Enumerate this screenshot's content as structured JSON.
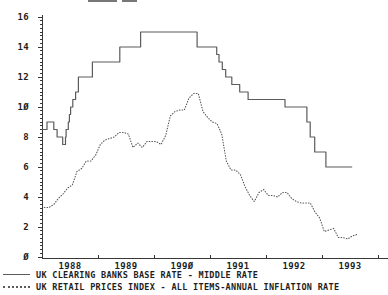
{
  "window": {
    "width": 388,
    "height": 295,
    "background": "#ffffff"
  },
  "colors": {
    "background": "#ffffff",
    "axis": "#383838",
    "text": "#1e1e1e",
    "base_rate_line": "#5b5b5b",
    "inflation_line": "#555555"
  },
  "chart_data": {
    "type": "line",
    "title": "",
    "grid": false,
    "legend_position": "bottom-left",
    "x_axis": {
      "label": "",
      "range": [
        1988,
        1994.2
      ],
      "tick_years": [
        1988,
        1989,
        1990,
        1991,
        1992,
        1993,
        1994
      ],
      "tick_labels": [
        "1988",
        "1989",
        "199Ø",
        "1991",
        "1992",
        "1993"
      ]
    },
    "y_axis": {
      "label": "",
      "range": [
        0,
        16
      ],
      "minor_step": 0.25,
      "tick_values": [
        0,
        2,
        4,
        6,
        8,
        10,
        12,
        14,
        16
      ],
      "tick_labels": [
        "Ø",
        "2",
        "4",
        "6",
        "8",
        "1Ø",
        "12",
        "14",
        "16"
      ]
    },
    "series": [
      {
        "name": "UK CLEARING BANKS BASE RATE - MIDDLE RATE",
        "style": "solid-step",
        "color": "#5b5b5b",
        "unit": "percent",
        "steps": [
          [
            1988.0,
            8.5
          ],
          [
            1988.09,
            9.0
          ],
          [
            1988.21,
            8.5
          ],
          [
            1988.27,
            8.0
          ],
          [
            1988.37,
            7.5
          ],
          [
            1988.42,
            8.0
          ],
          [
            1988.43,
            8.5
          ],
          [
            1988.47,
            9.0
          ],
          [
            1988.49,
            9.5
          ],
          [
            1988.51,
            10.0
          ],
          [
            1988.55,
            10.5
          ],
          [
            1988.6,
            11.0
          ],
          [
            1988.65,
            12.0
          ],
          [
            1988.9,
            13.0
          ],
          [
            1989.39,
            14.0
          ],
          [
            1989.76,
            15.0
          ],
          [
            1990.77,
            14.0
          ],
          [
            1991.12,
            13.5
          ],
          [
            1991.16,
            13.0
          ],
          [
            1991.22,
            12.5
          ],
          [
            1991.28,
            12.0
          ],
          [
            1991.39,
            11.5
          ],
          [
            1991.53,
            11.0
          ],
          [
            1991.68,
            10.5
          ],
          [
            1992.34,
            10.0
          ],
          [
            1992.73,
            9.0
          ],
          [
            1992.79,
            8.0
          ],
          [
            1992.87,
            7.0
          ],
          [
            1993.07,
            6.0
          ]
        ],
        "end_x": 1993.54
      },
      {
        "name": "UK RETAIL PRICES INDEX - ALL ITEMS-ANNUAL INFLATION RATE",
        "style": "dotted",
        "color": "#555555",
        "unit": "percent",
        "start_x": 1988.0417,
        "x_step": 0.083333,
        "values": [
          3.3,
          3.3,
          3.5,
          3.9,
          4.2,
          4.6,
          4.8,
          5.7,
          5.9,
          6.4,
          6.4,
          6.8,
          7.5,
          7.8,
          7.9,
          8.0,
          8.3,
          8.3,
          8.2,
          7.3,
          7.6,
          7.3,
          7.7,
          7.7,
          7.7,
          7.5,
          8.1,
          9.4,
          9.7,
          9.8,
          9.8,
          10.6,
          10.9,
          10.9,
          9.7,
          9.3,
          9.0,
          8.9,
          8.2,
          6.4,
          5.8,
          5.8,
          5.5,
          4.7,
          4.1,
          3.7,
          4.3,
          4.5,
          4.1,
          4.1,
          4.0,
          4.3,
          4.3,
          3.9,
          3.7,
          3.6,
          3.6,
          3.6,
          3.0,
          2.6,
          1.7,
          1.8,
          1.9,
          1.3,
          1.3,
          1.2,
          1.4,
          1.5
        ]
      }
    ],
    "legend": [
      {
        "label": "UK CLEARING BANKS BASE RATE - MIDDLE RATE",
        "line_style": "solid"
      },
      {
        "label": "UK RETAIL PRICES INDEX - ALL ITEMS-ANNUAL INFLATION RATE",
        "line_style": "dotted"
      }
    ]
  }
}
